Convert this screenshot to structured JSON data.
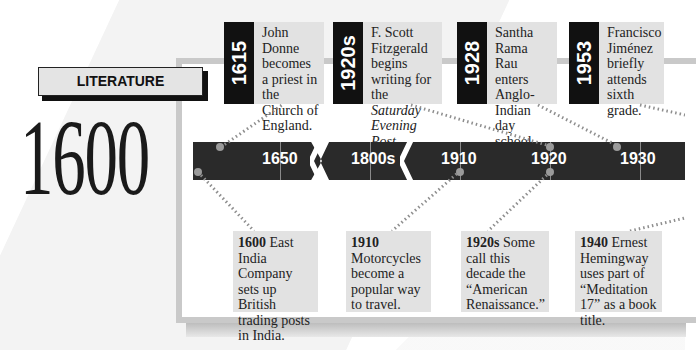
{
  "category_label": "LITERATURE",
  "era_year": "1600",
  "top_events": [
    {
      "year": "1615",
      "text": "John Donne becomes a priest in the Church of England."
    },
    {
      "year": "1920s",
      "text_before": "F. Scott Fitzgerald begins writing for the ",
      "text_italic": "Saturday Evening Post",
      "text_after": "."
    },
    {
      "year": "1928",
      "text": "Santha Rama Rau enters Anglo-Indian day school."
    },
    {
      "year": "1953",
      "text": "Francisco Jiménez briefly attends sixth grade."
    }
  ],
  "timeline_labels": [
    "1650",
    "1800s",
    "1910",
    "1920",
    "1930"
  ],
  "bottom_events": [
    {
      "year": "1600",
      "text": "East India Company sets up British trading posts in India."
    },
    {
      "year": "1910",
      "text": "Motorcycles become a popular way to travel."
    },
    {
      "year": "1920s",
      "text": "Some call this decade the “American Renaissance.”"
    },
    {
      "year": "1940",
      "text": "Ernest Hemingway uses part of “Meditation 17” as a book title."
    }
  ],
  "colors": {
    "bar": "#2a2a2a",
    "card": "#e2e2e2",
    "year_block": "#111111",
    "panel_border": "#c9c9c9"
  }
}
